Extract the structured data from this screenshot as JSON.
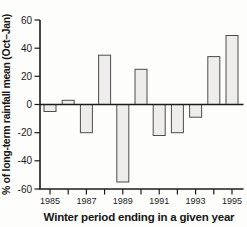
{
  "figure": {
    "kind": "scanned bar chart figure",
    "background": "#fdfdfb"
  },
  "chart_data": {
    "type": "bar",
    "title": "",
    "xlabel": "Winter period ending in a given year",
    "ylabel": "% of long-term rainfall mean (Oct–Jan)",
    "categories": [
      "1985",
      "1986",
      "1987",
      "1988",
      "1989",
      "1990",
      "1991",
      "1992",
      "1993",
      "1994",
      "1995"
    ],
    "values": [
      -5,
      3,
      -20,
      35,
      -55,
      25,
      -22,
      -20,
      -9,
      34,
      49
    ],
    "ylim": [
      -60,
      60
    ],
    "yticks": [
      60,
      40,
      20,
      0,
      -20,
      -40,
      -60
    ],
    "xtick_labels_shown": [
      "1985",
      "1987",
      "1989",
      "1991",
      "1993",
      "1995"
    ],
    "grid": false,
    "legend": "none",
    "baseline": 0,
    "bar_fill": "#eeedeb",
    "bar_stroke": "#4d4d4d",
    "axis_color": "#1b1b1b",
    "text_color": "#1c1c1c"
  }
}
